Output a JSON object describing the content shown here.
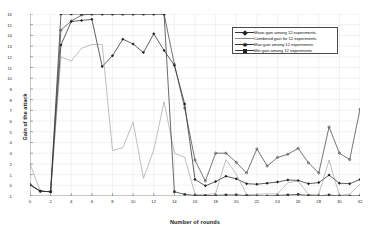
{
  "chart_data": {
    "type": "line",
    "title": "",
    "xlabel": "Number of rounds",
    "ylabel": "Gain of the attack",
    "xlim": [
      0,
      32
    ],
    "ylim": [
      -1,
      16
    ],
    "grid": true,
    "legend_position": "top-right",
    "xticks": [
      0,
      2,
      4,
      6,
      8,
      10,
      12,
      14,
      16,
      18,
      20,
      22,
      24,
      26,
      28,
      30,
      32
    ],
    "yticks": [
      -1,
      0,
      1,
      2,
      3,
      4,
      5,
      6,
      7,
      8,
      9,
      10,
      11,
      12,
      13,
      14,
      15,
      16
    ],
    "x": [
      0,
      1,
      2,
      3,
      4,
      5,
      6,
      7,
      8,
      9,
      10,
      11,
      12,
      13,
      14,
      15,
      16,
      17,
      18,
      19,
      20,
      21,
      22,
      23,
      24,
      25,
      26,
      27,
      28,
      29,
      30,
      31,
      32
    ],
    "series": [
      {
        "name": "Mean gain among 12 experiments",
        "marker": "diamond",
        "color": "#1c1c1c",
        "values": [
          0.05,
          -0.55,
          -0.6,
          13.1,
          15.3,
          15.4,
          15.5,
          11.1,
          12.1,
          13.65,
          13.2,
          12.4,
          14.15,
          12.6,
          11.2,
          7.6,
          0.55,
          -0.05,
          0.35,
          0.85,
          0.6,
          0.15,
          0.1,
          0.2,
          0.3,
          0.5,
          0.45,
          0.15,
          0.25,
          0.95,
          0.2,
          0.15,
          0.55
        ]
      },
      {
        "name": "Combined gain for 12 experiments",
        "marker": "none",
        "color": "#8a8a8a",
        "values": [
          2.0,
          -0.55,
          -0.6,
          12.0,
          11.6,
          12.8,
          13.15,
          13.15,
          3.25,
          3.5,
          5.9,
          0.65,
          3.3,
          7.8,
          3.0,
          2.6,
          -0.85,
          -0.9,
          -0.75,
          2.4,
          1.05,
          -0.85,
          -0.85,
          -0.8,
          -0.8,
          0.25,
          0.4,
          -0.85,
          -0.85,
          2.35,
          -0.95,
          -0.8,
          0.1
        ]
      },
      {
        "name": "Max gain among 12 experiments",
        "marker": "star",
        "color": "#3a3a3a",
        "values": [
          0.05,
          -0.55,
          -0.6,
          14.5,
          15.35,
          15.9,
          16.0,
          16.0,
          16.0,
          16.0,
          16.0,
          16.0,
          16.0,
          16.0,
          11.3,
          7.2,
          2.35,
          0.4,
          3.0,
          3.0,
          2.15,
          1.15,
          3.4,
          1.8,
          2.6,
          2.9,
          3.45,
          2.1,
          1.15,
          5.45,
          3.0,
          2.4,
          7.1
        ]
      },
      {
        "name": "Min gain among 12 experiments",
        "marker": "square",
        "color": "#2b2b2b",
        "values": [
          0.05,
          -0.55,
          -0.6,
          16.0,
          16.0,
          16.0,
          16.0,
          16.0,
          16.0,
          16.0,
          16.0,
          16.0,
          16.0,
          16.0,
          -0.6,
          -0.85,
          -0.95,
          -0.95,
          -0.95,
          -0.9,
          -0.9,
          -0.95,
          -1.0,
          -1.0,
          -0.95,
          -0.9,
          -0.85,
          -0.95,
          -1.0,
          -0.9,
          -1.0,
          -1.0,
          -1.0
        ]
      }
    ]
  }
}
